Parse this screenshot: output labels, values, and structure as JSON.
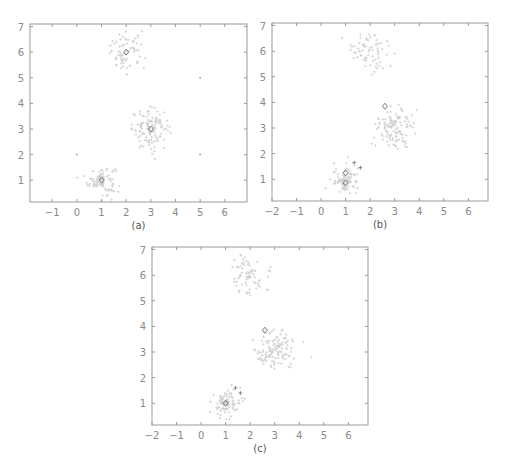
{
  "figure": {
    "background": "#ffffff",
    "axis_color": "#9a9a9a",
    "tick_label_color": "#8a8a8a",
    "point_color": "#cfcfcf",
    "marker_color": "#7a7a7a"
  },
  "chart_data": [
    {
      "type": "scatter",
      "caption": "(a)",
      "frame": {
        "left": 30,
        "top": 24,
        "right": 247,
        "bottom": 202
      },
      "xlim": [
        -1.9,
        6.9
      ],
      "ylim": [
        0.15,
        7.1
      ],
      "xticks": [
        -1,
        0,
        1,
        2,
        3,
        4,
        5,
        6
      ],
      "yticks": [
        1,
        2,
        3,
        4,
        5,
        6,
        7
      ],
      "grid": false,
      "clusters": [
        {
          "center": [
            1.0,
            1.0
          ],
          "std": 0.28,
          "n": 90
        },
        {
          "center": [
            3.0,
            3.0
          ],
          "std": 0.38,
          "n": 120
        },
        {
          "center": [
            2.0,
            6.0
          ],
          "std": 0.38,
          "n": 70
        }
      ],
      "diamond_markers": [
        [
          1.0,
          1.0
        ],
        [
          3.0,
          3.0
        ],
        [
          2.0,
          6.0
        ]
      ],
      "dot_markers": [
        [
          0.0,
          2.0
        ],
        [
          5.0,
          2.0
        ],
        [
          5.0,
          5.0
        ]
      ],
      "plus_markers": []
    },
    {
      "type": "scatter",
      "caption": "(b)",
      "frame": {
        "left": 272,
        "top": 23,
        "right": 488,
        "bottom": 201
      },
      "xlim": [
        -2.0,
        6.8
      ],
      "ylim": [
        0.15,
        7.1
      ],
      "xticks": [
        -2,
        -1,
        0,
        1,
        2,
        3,
        4,
        5,
        6
      ],
      "yticks": [
        1,
        2,
        3,
        4,
        5,
        6,
        7
      ],
      "grid": false,
      "clusters": [
        {
          "center": [
            1.0,
            1.0
          ],
          "std": 0.28,
          "n": 90
        },
        {
          "center": [
            3.0,
            3.0
          ],
          "std": 0.38,
          "n": 120
        },
        {
          "center": [
            2.0,
            6.0
          ],
          "std": 0.38,
          "n": 70
        }
      ],
      "diamond_markers": [
        [
          1.0,
          1.25
        ],
        [
          1.0,
          0.85
        ],
        [
          2.6,
          3.85
        ]
      ],
      "dot_markers": [],
      "plus_markers": [
        [
          1.35,
          1.65
        ],
        [
          1.6,
          1.45
        ]
      ]
    },
    {
      "type": "scatter",
      "caption": "(c)",
      "frame": {
        "left": 152,
        "top": 247,
        "right": 368,
        "bottom": 425
      },
      "xlim": [
        -2.0,
        6.8
      ],
      "ylim": [
        0.15,
        7.1
      ],
      "xticks": [
        -2,
        -1,
        0,
        1,
        2,
        3,
        4,
        5,
        6
      ],
      "yticks": [
        1,
        2,
        3,
        4,
        5,
        6,
        7
      ],
      "grid": false,
      "clusters": [
        {
          "center": [
            1.0,
            1.0
          ],
          "std": 0.28,
          "n": 90
        },
        {
          "center": [
            3.0,
            3.0
          ],
          "std": 0.38,
          "n": 120
        },
        {
          "center": [
            2.0,
            6.0
          ],
          "std": 0.38,
          "n": 70
        }
      ],
      "diamond_markers": [
        [
          1.0,
          1.0
        ],
        [
          2.6,
          3.85
        ]
      ],
      "dot_markers": [],
      "plus_markers": [
        [
          1.4,
          1.6
        ],
        [
          1.6,
          1.4
        ]
      ]
    }
  ]
}
